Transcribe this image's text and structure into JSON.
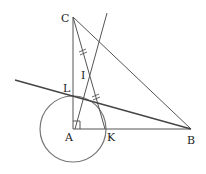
{
  "figure": {
    "type": "geometry-diagram"
  },
  "points": {
    "C": {
      "label": "C",
      "x": 73,
      "y": 17
    },
    "A": {
      "label": "A",
      "x": 73,
      "y": 129
    },
    "B": {
      "label": "B",
      "x": 191,
      "y": 129
    },
    "K": {
      "label": "K",
      "x": 105,
      "y": 129
    },
    "L": {
      "label": "L",
      "x": 73,
      "y": 96
    },
    "I": {
      "label": "I",
      "x": 89,
      "y": 73
    }
  },
  "labels": {
    "C": "C",
    "A": "A",
    "B": "B",
    "K": "K",
    "L": "L",
    "I": "I"
  },
  "circle": {
    "center": "A",
    "radius": 33
  },
  "marks": {
    "right_angle_at": "A",
    "equal_segments": [
      "CI",
      "IK"
    ]
  },
  "colors": {
    "line": "#555555",
    "circle": "#777777",
    "text": "#222222",
    "background": "#ffffff"
  }
}
